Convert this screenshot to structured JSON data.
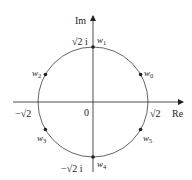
{
  "diagram": {
    "type": "complex-plane-roots",
    "axes": {
      "real_label": "Re",
      "imag_label": "Im",
      "origin_label": "0"
    },
    "circle": {
      "radius_label_pos_real": "√2",
      "radius_label_neg_real": "−√2",
      "radius_label_pos_imag": "√2 i",
      "radius_label_neg_imag": "−√2 i"
    },
    "points": [
      {
        "name": "w",
        "sub": "0",
        "angle_deg": 30
      },
      {
        "name": "w",
        "sub": "1",
        "angle_deg": 90
      },
      {
        "name": "w",
        "sub": "2",
        "angle_deg": 150
      },
      {
        "name": "w",
        "sub": "3",
        "angle_deg": 210
      },
      {
        "name": "w",
        "sub": "4",
        "angle_deg": 270
      },
      {
        "name": "w",
        "sub": "5",
        "angle_deg": 330
      }
    ],
    "colors": {
      "ink": "#231f20",
      "circle": "#555555"
    }
  }
}
